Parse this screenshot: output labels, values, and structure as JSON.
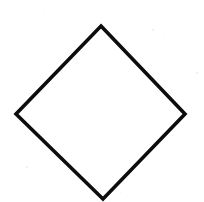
{
  "image": {
    "width": 204,
    "height": 202,
    "background_color": "#ffffff",
    "description": "scanned black diamond outline on white paper"
  },
  "figure": {
    "name": "diamond",
    "shape_type": "polygon",
    "sides": 4,
    "filled": false,
    "fill_color": "#ffffff",
    "stroke_color": "#0d0d0d",
    "stroke_width": 3.6,
    "stroke_linejoin": "miter",
    "points": "101,26 185,114 103,199 16,114",
    "vertices": [
      {
        "name": "top-vertex",
        "x": 101,
        "y": 26
      },
      {
        "name": "right-vertex",
        "x": 185,
        "y": 114
      },
      {
        "name": "bottom-vertex",
        "x": 103,
        "y": 199
      },
      {
        "name": "left-vertex",
        "x": 16,
        "y": 114
      }
    ]
  },
  "noise": {
    "color": "#ededed",
    "specks": [
      {
        "x": 152,
        "y": 29,
        "size": 2
      },
      {
        "x": 163,
        "y": 33,
        "size": 1
      },
      {
        "x": 44,
        "y": 12,
        "size": 1
      },
      {
        "x": 196,
        "y": 72,
        "size": 2
      },
      {
        "x": 74,
        "y": 5,
        "size": 1
      },
      {
        "x": 26,
        "y": 166,
        "size": 2
      },
      {
        "x": 13,
        "y": 63,
        "size": 1
      },
      {
        "x": 186,
        "y": 160,
        "size": 1
      },
      {
        "x": 120,
        "y": 192,
        "size": 1
      },
      {
        "x": 58,
        "y": 186,
        "size": 1
      }
    ]
  }
}
